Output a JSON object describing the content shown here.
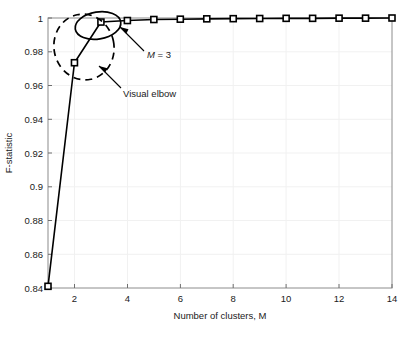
{
  "chart_data": {
    "type": "line",
    "title": "",
    "xlabel": "Number of clusters, M",
    "ylabel": "F-statistic",
    "x": [
      1,
      2,
      3,
      4,
      5,
      6,
      7,
      8,
      9,
      10,
      11,
      12,
      13,
      14
    ],
    "values": [
      0.841,
      0.9735,
      0.9976,
      0.9985,
      0.9991,
      0.9993,
      0.9995,
      0.9996,
      0.9997,
      0.9998,
      0.9998,
      0.9999,
      0.9999,
      1.0
    ],
    "series": [
      {
        "name": "F-statistic",
        "values": [
          0.841,
          0.9735,
          0.9976,
          0.9985,
          0.9991,
          0.9993,
          0.9995,
          0.9996,
          0.9997,
          0.9998,
          0.9998,
          0.9999,
          0.9999,
          1.0
        ],
        "marker": "square",
        "line_color": "#000000",
        "marker_color": "#000000"
      }
    ],
    "xlim": [
      1,
      14
    ],
    "ylim": [
      0.84,
      1.0
    ],
    "xticks": [
      2,
      4,
      6,
      8,
      10,
      12,
      14
    ],
    "xtick_labels": [
      "2",
      "4",
      "6",
      "8",
      "10",
      "12",
      "14"
    ],
    "yticks": [
      0.84,
      0.86,
      0.88,
      0.9,
      0.92,
      0.94,
      0.96,
      0.98,
      1.0
    ],
    "ytick_labels": [
      "0.84",
      "0.86",
      "0.88",
      "0.9",
      "0.92",
      "0.94",
      "0.96",
      "0.98",
      "1"
    ],
    "grid": true,
    "grid_color": "#f0f0f0",
    "legend": null,
    "background": "#ffffff",
    "axis_color": "#8c8c8c",
    "annotations": [
      {
        "id": "m-equals-3",
        "text_italic": "M",
        "text_rest": " = 3",
        "text": "M = 3",
        "target_point": [
          3,
          0.9976
        ],
        "shape": "solid-ellipse",
        "shape_style": "solid",
        "color": "#000000"
      },
      {
        "id": "visual-elbow",
        "text": "Visual elbow",
        "target_point": [
          2,
          0.9735
        ],
        "shape": "dashed-ellipse",
        "shape_style": "dashed",
        "color": "#000000"
      }
    ]
  }
}
